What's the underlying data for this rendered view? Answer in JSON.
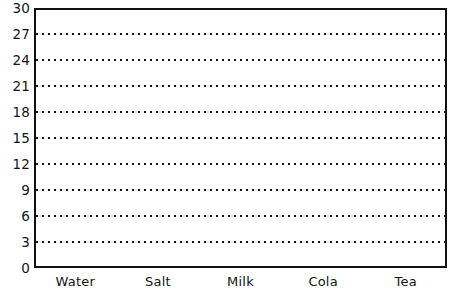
{
  "chart_data": {
    "type": "bar",
    "title": "",
    "subtitle": "",
    "xlabel": "",
    "ylabel": "",
    "categories": [
      "Water",
      "Salt",
      "Milk",
      "Cola",
      "Tea"
    ],
    "values": [
      null,
      null,
      null,
      null,
      null
    ],
    "series": [
      {
        "name": "",
        "values": [
          null,
          null,
          null,
          null,
          null
        ]
      }
    ],
    "ylim": [
      0,
      30
    ],
    "ytick_step": 3,
    "ytick_labels": [
      "0",
      "3",
      "6",
      "9",
      "12",
      "15",
      "18",
      "21",
      "24",
      "27",
      "30"
    ],
    "ytick_values": [
      0,
      3,
      6,
      9,
      12,
      15,
      18,
      21,
      24,
      27,
      30
    ],
    "gridline_values": [
      3,
      6,
      9,
      12,
      15,
      18,
      21,
      24,
      27
    ],
    "grid": true,
    "grid_style": "dotted",
    "grid_axis": "y",
    "legend": false,
    "legend_position": "none",
    "annotations": [],
    "note": "Blank bar-chart grid template; no bars plotted.",
    "colors": {
      "axis": "#111111",
      "grid": "#111111",
      "text": "#141414",
      "plot_background": "#ffffff",
      "figure_background": "#ffffff"
    }
  }
}
